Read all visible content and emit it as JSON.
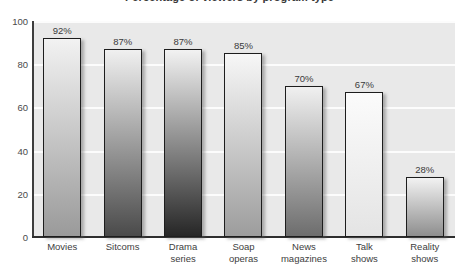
{
  "chart_data": {
    "type": "bar",
    "title": "Percentage of viewers by program type",
    "xlabel": "",
    "ylabel": "",
    "ylim": [
      0,
      100
    ],
    "yticks": [
      0,
      20,
      40,
      60,
      80,
      100
    ],
    "ytick_labels": [
      "0",
      "20",
      "40",
      "60",
      "80",
      "100"
    ],
    "grid": true,
    "legend": "none",
    "categories": [
      "Movies",
      "Sitcoms",
      "Drama series",
      "Soap operas",
      "News magazines",
      "Talk shows",
      "Reality shows"
    ],
    "category_lines": [
      [
        "Movies"
      ],
      [
        "Sitcoms"
      ],
      [
        "Drama",
        "series"
      ],
      [
        "Soap",
        "operas"
      ],
      [
        "News",
        "magazines"
      ],
      [
        "Talk",
        "shows"
      ],
      [
        "Reality",
        "shows"
      ]
    ],
    "values": [
      92,
      87,
      87,
      85,
      70,
      67,
      28
    ],
    "value_labels": [
      "92%",
      "87%",
      "87%",
      "85%",
      "70%",
      "67%",
      "28%"
    ],
    "bar_colors_top": [
      "#f2f2f2",
      "#f0f0f0",
      "#f2f2f2",
      "#f7f7f7",
      "#f0f0f0",
      "#fbfbfb",
      "#f2f2f2"
    ],
    "bar_colors_bottom": [
      "#9a9a9a",
      "#4a4a4a",
      "#262626",
      "#9d9d9d",
      "#6d6d6d",
      "#e4e4e4",
      "#8e8e8e"
    ],
    "plot_background": "#e9e9e9",
    "gridline_color": "#fcfcfc",
    "axis_color": "#2e2e2e",
    "text_color": "#3d3d3d"
  }
}
